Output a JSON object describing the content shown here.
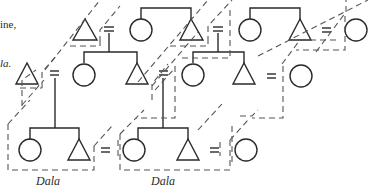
{
  "colors": {
    "ink": "#2a2a2a",
    "dash": "#555555",
    "background": "#ffffff"
  },
  "text_fragments": {
    "line1": "ine,",
    "line2": "la."
  },
  "labels": {
    "dala_left": "Dala",
    "dala_right": "Dala"
  },
  "symbols": {
    "male": "triangle",
    "female": "circle",
    "marriage": "=",
    "household_boundary": "dashed-outline"
  },
  "rows": [
    {
      "name": "top",
      "units": [
        {
          "male": "triangle",
          "marriage": "=",
          "female": "circle"
        },
        {
          "male": "triangle",
          "marriage": "=",
          "female": "circle"
        },
        {
          "male": "triangle",
          "marriage": "=",
          "female": "circle"
        }
      ]
    },
    {
      "name": "middle",
      "units": [
        {
          "male": "triangle",
          "marriage": "=",
          "female": "circle"
        },
        {
          "male": "triangle",
          "marriage": "=",
          "female": "circle"
        },
        {
          "male": "triangle",
          "marriage": "=",
          "female": "circle"
        }
      ]
    },
    {
      "name": "bottom",
      "units": [
        {
          "female": "circle",
          "male": "triangle",
          "marriage": "=",
          "female2": "circle"
        },
        {
          "female": "circle",
          "male": "triangle",
          "marriage": "=",
          "female2": "circle"
        }
      ]
    }
  ]
}
